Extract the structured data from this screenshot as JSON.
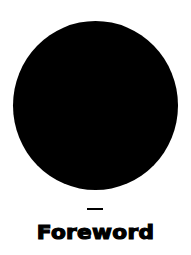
{
  "cover": {
    "graphic": "black-circle",
    "separator": "—",
    "title": "Foreword",
    "colors": {
      "background": "#ffffff",
      "foreground": "#000000"
    }
  }
}
